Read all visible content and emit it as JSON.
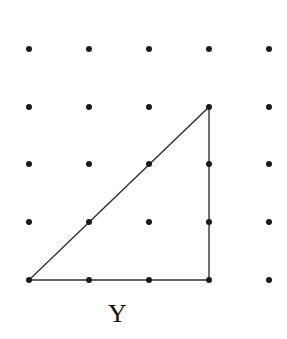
{
  "diagram": {
    "type": "dot-grid-triangle",
    "grid": {
      "columns_x": [
        29,
        89,
        149,
        209,
        269
      ],
      "rows_y": [
        49,
        107,
        164,
        222,
        280
      ],
      "dot_radius": 3,
      "dot_color": "#1a1a1a"
    },
    "triangle": {
      "vertices": [
        [
          29,
          280
        ],
        [
          209,
          280
        ],
        [
          209,
          107
        ]
      ],
      "grid_vertices": [
        [
          0,
          4
        ],
        [
          3,
          4
        ],
        [
          3,
          1
        ]
      ],
      "stroke": "#333333",
      "stroke_width": 1.4
    },
    "label": {
      "text": "Y",
      "x": 108,
      "y": 301
    }
  }
}
